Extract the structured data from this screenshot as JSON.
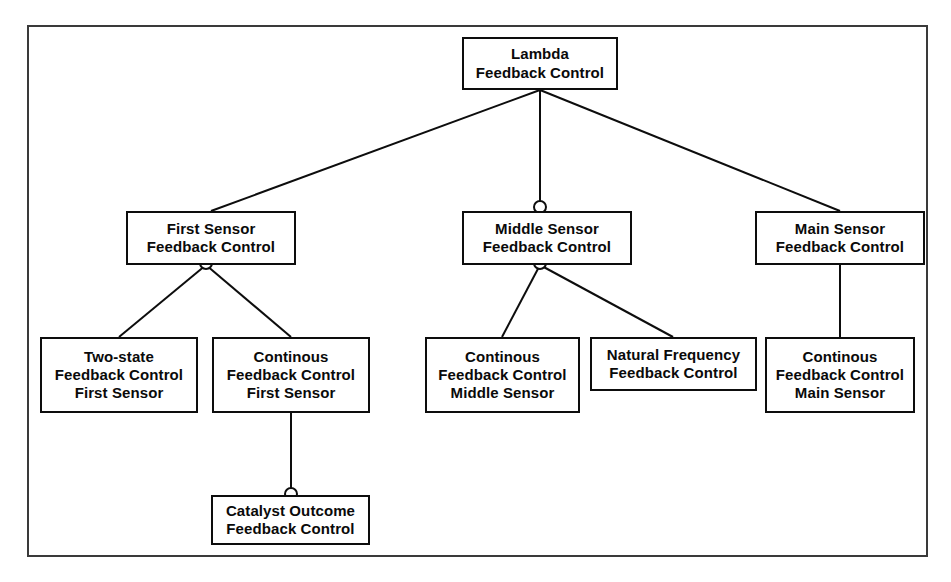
{
  "diagram": {
    "background_color": "#ffffff",
    "frame_color": "#3a3a3a",
    "node_border_color": "#0d0d0d",
    "edge_color": "#0d0d0d",
    "text_color": "#0a0a0a",
    "levels": 4
  },
  "nodes": {
    "lambda": {
      "id": "lambda",
      "lines": [
        "Lambda",
        "Feedback Control"
      ],
      "line1": "Lambda",
      "line2": "Feedback Control",
      "x": 462,
      "y": 37,
      "w": 156,
      "h": 53,
      "level": 1
    },
    "first_sensor": {
      "id": "first-sensor",
      "lines": [
        "First Sensor",
        "Feedback Control"
      ],
      "line1": "First Sensor",
      "line2": "Feedback Control",
      "x": 126,
      "y": 211,
      "w": 170,
      "h": 54,
      "level": 2
    },
    "middle_sensor": {
      "id": "middle-sensor",
      "lines": [
        "Middle Sensor",
        "Feedback Control"
      ],
      "line1": "Middle Sensor",
      "line2": "Feedback Control",
      "x": 462,
      "y": 211,
      "w": 170,
      "h": 54,
      "level": 2
    },
    "main_sensor": {
      "id": "main-sensor",
      "lines": [
        "Main Sensor",
        "Feedback Control"
      ],
      "line1": "Main Sensor",
      "line2": "Feedback Control",
      "x": 755,
      "y": 211,
      "w": 170,
      "h": 54,
      "level": 2
    },
    "two_state_first": {
      "id": "two-state-feedback-control-first-sensor",
      "lines": [
        "Two-state",
        "Feedback Control",
        "First Sensor"
      ],
      "line1": "Two-state",
      "line2": "Feedback Control",
      "line3": "First Sensor",
      "x": 40,
      "y": 337,
      "w": 158,
      "h": 76,
      "level": 3
    },
    "continous_first": {
      "id": "continous-feedback-control-first-sensor",
      "lines": [
        "Continous",
        "Feedback Control",
        "First Sensor"
      ],
      "line1": "Continous",
      "line2": "Feedback Control",
      "line3": "First Sensor",
      "x": 212,
      "y": 337,
      "w": 158,
      "h": 76,
      "level": 3
    },
    "continous_middle": {
      "id": "continous-feedback-control-middle-sensor",
      "lines": [
        "Continous",
        "Feedback Control",
        "Middle Sensor"
      ],
      "line1": "Continous",
      "line2": "Feedback Control",
      "line3": "Middle Sensor",
      "x": 425,
      "y": 337,
      "w": 155,
      "h": 76,
      "level": 3
    },
    "natural_frequency": {
      "id": "natural-frequency-feedback-control",
      "lines": [
        "Natural Frequency",
        "Feedback Control"
      ],
      "line1": "Natural Frequency",
      "line2": "Feedback Control",
      "x": 590,
      "y": 337,
      "w": 167,
      "h": 54,
      "level": 3
    },
    "continous_main": {
      "id": "continous-feedback-control-main-sensor",
      "lines": [
        "Continous",
        "Feedback Control",
        "Main Sensor"
      ],
      "line1": "Continous",
      "line2": "Feedback Control",
      "line3": "Main Sensor",
      "x": 765,
      "y": 337,
      "w": 150,
      "h": 76,
      "level": 3
    },
    "catalyst_outcome": {
      "id": "catalyst-outcome-feedback-control",
      "lines": [
        "Catalyst Outcome",
        "Feedback Control"
      ],
      "line1": "Catalyst Outcome",
      "line2": "Feedback Control",
      "x": 211,
      "y": 495,
      "w": 159,
      "h": 50,
      "level": 4
    }
  },
  "edges": [
    {
      "from": "lambda",
      "to": "first_sensor",
      "x1": 540,
      "y1": 90,
      "x2": 211,
      "y2": 211
    },
    {
      "from": "lambda",
      "to": "middle_sensor",
      "x1": 540,
      "y1": 90,
      "x2": 540,
      "y2": 211
    },
    {
      "from": "lambda",
      "to": "main_sensor",
      "x1": 540,
      "y1": 90,
      "x2": 840,
      "y2": 211
    },
    {
      "from": "first_sensor",
      "to": "two_state_first",
      "x1": 206,
      "y1": 265,
      "x2": 119,
      "y2": 337
    },
    {
      "from": "first_sensor",
      "to": "continous_first",
      "x1": 206,
      "y1": 265,
      "x2": 291,
      "y2": 337
    },
    {
      "from": "middle_sensor",
      "to": "continous_middle",
      "x1": 540,
      "y1": 265,
      "x2": 502,
      "y2": 337
    },
    {
      "from": "middle_sensor",
      "to": "natural_frequency",
      "x1": 540,
      "y1": 265,
      "x2": 673,
      "y2": 337
    },
    {
      "from": "main_sensor",
      "to": "continous_main",
      "x1": 840,
      "y1": 265,
      "x2": 840,
      "y2": 337
    },
    {
      "from": "continous_first",
      "to": "catalyst_outcome",
      "x1": 291,
      "y1": 413,
      "x2": 291,
      "y2": 495
    }
  ],
  "junction_markers": [
    {
      "name": "middle-sensor-top-junction",
      "x": 540,
      "y": 207,
      "r": 6
    },
    {
      "name": "first-sensor-bottom-junction",
      "x": 206,
      "y": 263,
      "r": 6
    },
    {
      "name": "middle-sensor-bottom-junction",
      "x": 540,
      "y": 263,
      "r": 6
    },
    {
      "name": "catalyst-outcome-top-junction",
      "x": 291,
      "y": 494,
      "r": 6
    }
  ]
}
